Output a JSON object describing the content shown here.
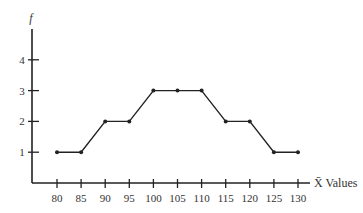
{
  "chart_data": {
    "type": "line",
    "title": "",
    "xlabel": "X̄ Values",
    "ylabel": "f",
    "x": [
      80,
      85,
      90,
      95,
      100,
      105,
      110,
      115,
      120,
      125,
      130
    ],
    "categories": [
      "80",
      "85",
      "90",
      "95",
      "100",
      "105",
      "110",
      "115",
      "120",
      "125",
      "130"
    ],
    "series": [
      {
        "name": "frequency",
        "values": [
          1,
          1,
          2,
          2,
          3,
          3,
          3,
          2,
          2,
          1,
          1
        ]
      }
    ],
    "yticks": [
      1,
      2,
      3,
      4
    ],
    "ylim": [
      0,
      5
    ],
    "grid": false,
    "legend": null,
    "colors": {
      "line": "#222222",
      "axis": "#222222",
      "text": "#333333"
    }
  }
}
